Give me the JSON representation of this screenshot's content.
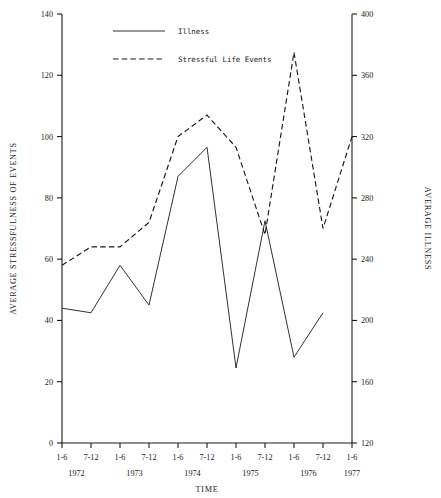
{
  "chart_data": {
    "type": "line",
    "title": "",
    "xlabel": "TIME",
    "ylabel": "AVERAGE STRESSFULNESS OF EVENTS",
    "y2label": "AVERAGE ILLNESS",
    "grid": false,
    "legend_position": "top-center",
    "categories": [
      "1-6",
      "7-12",
      "1-6",
      "7-12",
      "1-6",
      "7-12",
      "1-6",
      "7-12",
      "1-6",
      "7-12",
      "1-6"
    ],
    "year_groups": [
      {
        "year": "1972",
        "span": 2
      },
      {
        "year": "1973",
        "span": 2
      },
      {
        "year": "1974",
        "span": 2
      },
      {
        "year": "1975",
        "span": 2
      },
      {
        "year": "1976",
        "span": 2
      },
      {
        "year": "1977",
        "span": 1
      }
    ],
    "ylim": [
      0,
      140
    ],
    "yticks": [
      0,
      20,
      40,
      60,
      80,
      100,
      120,
      140
    ],
    "y2lim": [
      120,
      400
    ],
    "y2ticks": [
      120,
      160,
      200,
      240,
      280,
      320,
      360,
      400
    ],
    "series": [
      {
        "name": "Illness",
        "style": "solid",
        "axis": "right",
        "values_left_scale": [
          44,
          42.5,
          58,
          45,
          87,
          96.5,
          24.5,
          72.5,
          28,
          42.5,
          null
        ],
        "values": [
          208,
          205,
          236,
          210,
          294,
          313,
          169,
          265,
          176,
          205,
          null
        ]
      },
      {
        "name": "Stressful Life Events",
        "style": "dashed",
        "axis": "left",
        "values": [
          58,
          64,
          64,
          72,
          100,
          107,
          96.5,
          68,
          127.5,
          70,
          100
        ]
      }
    ]
  },
  "legend": {
    "items": [
      {
        "label": "Illness",
        "style": "solid"
      },
      {
        "label": "Stressful Life Events",
        "style": "dashed"
      }
    ]
  }
}
